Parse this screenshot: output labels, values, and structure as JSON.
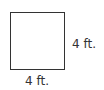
{
  "diagram": {
    "shape": "square",
    "side_right_label": "4 ft.",
    "side_bottom_label": "4 ft."
  }
}
